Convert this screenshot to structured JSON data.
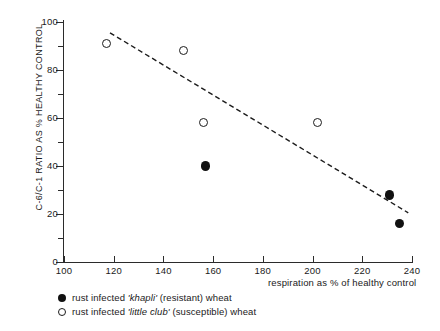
{
  "chart_data": {
    "type": "scatter",
    "title": "",
    "xlabel": "respiration as % of healthy control",
    "ylabel": "C-6/C-1 RATIO AS % HEALTHY CONTROL",
    "xlim": [
      100,
      240
    ],
    "ylim": [
      0,
      100
    ],
    "xticks": [
      100,
      120,
      140,
      160,
      180,
      200,
      220,
      240
    ],
    "yticks": [
      0,
      20,
      40,
      60,
      80,
      100
    ],
    "y_minor_ticks": [
      10,
      30,
      50,
      70,
      90
    ],
    "grid": false,
    "legend_position": "below-left",
    "series": [
      {
        "name": "rust infected 'khapli' (resistant) wheat",
        "marker": "filled-circle",
        "color": "#111111",
        "points": [
          {
            "x": 157,
            "y": 40
          },
          {
            "x": 231,
            "y": 28
          },
          {
            "x": 235,
            "y": 16
          }
        ]
      },
      {
        "name": "rust infected 'little club' (susceptible) wheat",
        "marker": "open-circle",
        "color": "#1c1c1c",
        "points": [
          {
            "x": 117,
            "y": 91
          },
          {
            "x": 148,
            "y": 88
          },
          {
            "x": 156,
            "y": 58
          },
          {
            "x": 202,
            "y": 58
          }
        ]
      }
    ],
    "trendline": {
      "style": "dashed",
      "color": "#1c1c1c",
      "x_start": 118.5,
      "y_start": 95.5,
      "x_end": 238.5,
      "y_end": 20.5
    }
  },
  "axes": {
    "y_title": "C-6/C-1 RATIO AS % HEALTHY CONTROL",
    "x_title": "respiration as % of healthy control",
    "y_tick_labels": [
      "100",
      "80",
      "60",
      "40",
      "20",
      "0"
    ],
    "x_tick_labels": [
      "100",
      "120",
      "140",
      "160",
      "180",
      "200",
      "220",
      "240"
    ]
  },
  "legend": {
    "items": [
      {
        "marker": "filled-circle",
        "prefix": "rust infected ",
        "emphasis": "'khapli'",
        "suffix": " (resistant) wheat"
      },
      {
        "marker": "open-circle",
        "prefix": "rust infected ",
        "emphasis": "'little club'",
        "suffix": " (susceptible) wheat"
      }
    ]
  }
}
